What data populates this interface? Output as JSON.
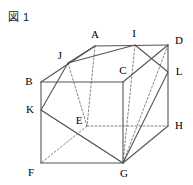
{
  "figure": {
    "caption": "図 1",
    "stroke_color": "#555555",
    "dashed_color": "#777777",
    "label_color": "#000000",
    "background": "#ffffff"
  },
  "vertices": [
    {
      "id": "A",
      "label": "A",
      "x": 95,
      "y": 46,
      "lx": 95,
      "ly": 35,
      "kind": "cube-corner",
      "hidden": false
    },
    {
      "id": "B",
      "label": "B",
      "x": 41,
      "y": 82,
      "lx": 29,
      "ly": 82,
      "kind": "cube-corner",
      "hidden": false
    },
    {
      "id": "C",
      "label": "C",
      "x": 123,
      "y": 82,
      "lx": 123,
      "ly": 71,
      "kind": "cube-corner",
      "hidden": false
    },
    {
      "id": "D",
      "label": "D",
      "x": 168,
      "y": 45,
      "lx": 179,
      "ly": 41,
      "kind": "cube-corner",
      "hidden": false
    },
    {
      "id": "E",
      "label": "E",
      "x": 87,
      "y": 126,
      "lx": 79,
      "ly": 121,
      "kind": "cube-corner",
      "hidden": true
    },
    {
      "id": "F",
      "label": "F",
      "x": 41,
      "y": 163,
      "lx": 31,
      "ly": 173,
      "kind": "cube-corner",
      "hidden": false
    },
    {
      "id": "G",
      "label": "G",
      "x": 123,
      "y": 163,
      "lx": 124,
      "ly": 174,
      "kind": "cube-corner",
      "hidden": false
    },
    {
      "id": "H",
      "label": "H",
      "x": 168,
      "y": 126,
      "lx": 179,
      "ly": 126,
      "kind": "cube-corner",
      "hidden": false
    },
    {
      "id": "I",
      "label": "I",
      "x": 135,
      "y": 45,
      "lx": 134,
      "ly": 34,
      "kind": "cut-point",
      "hidden": false
    },
    {
      "id": "J",
      "label": "J",
      "x": 68,
      "y": 63,
      "lx": 60,
      "ly": 56,
      "kind": "cut-point",
      "hidden": false
    },
    {
      "id": "K",
      "label": "K",
      "x": 41,
      "y": 110,
      "lx": 30,
      "ly": 110,
      "kind": "cut-point",
      "hidden": false
    },
    {
      "id": "L",
      "label": "L",
      "x": 168,
      "y": 72,
      "lx": 179,
      "ly": 72,
      "kind": "cut-point",
      "hidden": false
    }
  ],
  "edges_solid": [
    {
      "name": "edge-B-C",
      "from": "B",
      "to": "C"
    },
    {
      "name": "edge-C-G",
      "from": "C",
      "to": "G"
    },
    {
      "name": "edge-G-F",
      "from": "G",
      "to": "F"
    },
    {
      "name": "edge-F-B",
      "from": "F",
      "to": "B"
    },
    {
      "name": "edge-A-D",
      "from": "A",
      "to": "D"
    },
    {
      "name": "edge-D-H",
      "from": "D",
      "to": "H"
    },
    {
      "name": "edge-H-G",
      "from": "H",
      "to": "G"
    },
    {
      "name": "edge-C-D",
      "from": "C",
      "to": "D"
    },
    {
      "name": "edge-B-A",
      "from": "B",
      "to": "A"
    },
    {
      "name": "edge-J-A",
      "from": "J",
      "to": "A"
    }
  ],
  "edges_dashed": [
    {
      "name": "edge-A-E",
      "from": "A",
      "to": "E"
    },
    {
      "name": "edge-E-H",
      "from": "E",
      "to": "H"
    },
    {
      "name": "edge-E-F",
      "from": "E",
      "to": "F"
    },
    {
      "name": "edge-J-E",
      "from": "J",
      "to": "E"
    },
    {
      "name": "edge-I-G",
      "from": "I",
      "to": "G"
    },
    {
      "name": "edge-D-G",
      "from": "D",
      "to": "G"
    },
    {
      "name": "edge-K-G",
      "from": "K",
      "to": "G"
    }
  ],
  "cut_polygon": {
    "name": "cut-plane-outline",
    "points": [
      "J",
      "I",
      "L",
      "G",
      "K"
    ]
  }
}
